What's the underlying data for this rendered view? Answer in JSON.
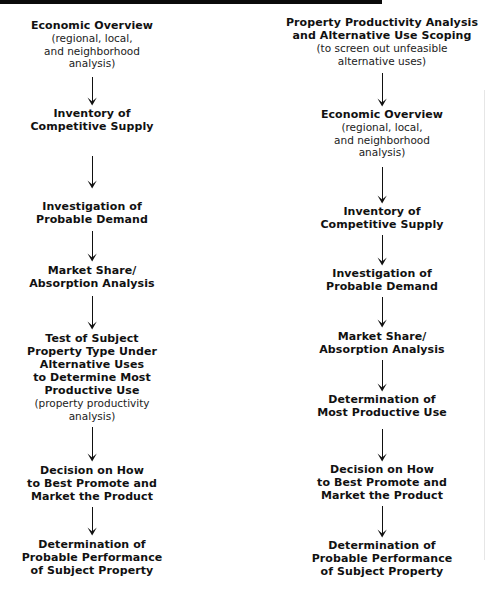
{
  "diagram": {
    "left_column": {
      "center_x": 92,
      "nodes": [
        {
          "top": 19,
          "title": [
            "Economic Overview"
          ],
          "sub": [
            "(regional, local,",
            "and neighborhood",
            "analysis)"
          ]
        },
        {
          "top": 107,
          "title": [
            "Inventory of",
            "Competitive Supply"
          ],
          "sub": []
        },
        {
          "top": 200,
          "title": [
            "Investigation of",
            "Probable Demand"
          ],
          "sub": []
        },
        {
          "top": 264,
          "title": [
            "Market Share/",
            "Absorption Analysis"
          ],
          "sub": []
        },
        {
          "top": 332,
          "title": [
            "Test of Subject",
            "Property Type Under",
            "Alternative Uses",
            "to Determine Most",
            "Productive Use"
          ],
          "sub": [
            "(property productivity",
            "analysis)"
          ]
        },
        {
          "top": 464,
          "title": [
            "Decision on How",
            "to Best Promote and",
            "Market the Product"
          ],
          "sub": []
        },
        {
          "top": 538,
          "title": [
            "Determination of",
            "Probable Performance",
            "of Subject Property"
          ],
          "sub": []
        }
      ],
      "arrows": [
        {
          "top": 77,
          "height": 29
        },
        {
          "top": 156,
          "height": 33
        },
        {
          "top": 231,
          "height": 31
        },
        {
          "top": 296,
          "height": 34
        },
        {
          "top": 427,
          "height": 35
        },
        {
          "top": 507,
          "height": 29
        }
      ]
    },
    "right_column": {
      "center_x": 382,
      "nodes": [
        {
          "top": 16,
          "title": [
            "Property Productivity Analysis",
            "and Alternative Use Scoping"
          ],
          "sub": [
            "(to screen out unfeasible",
            "alternative uses)"
          ]
        },
        {
          "top": 108,
          "title": [
            "Economic Overview"
          ],
          "sub": [
            "(regional, local,",
            "and neighborhood",
            "analysis)"
          ]
        },
        {
          "top": 205,
          "title": [
            "Inventory of",
            "Competitive Supply"
          ],
          "sub": []
        },
        {
          "top": 267,
          "title": [
            "Investigation of",
            "Probable Demand"
          ],
          "sub": []
        },
        {
          "top": 330,
          "title": [
            "Market Share/",
            "Absorption Analysis"
          ],
          "sub": []
        },
        {
          "top": 393,
          "title": [
            "Determination of",
            "Most Productive Use"
          ],
          "sub": []
        },
        {
          "top": 463,
          "title": [
            "Decision on How",
            "to Best Promote and",
            "Market the Product"
          ],
          "sub": []
        },
        {
          "top": 539,
          "title": [
            "Determination of",
            "Probable Performance",
            "of Subject Property"
          ],
          "sub": []
        }
      ],
      "arrows": [
        {
          "top": 73,
          "height": 34
        },
        {
          "top": 167,
          "height": 37
        },
        {
          "top": 235,
          "height": 31
        },
        {
          "top": 297,
          "height": 31
        },
        {
          "top": 360,
          "height": 32
        },
        {
          "top": 429,
          "height": 33
        },
        {
          "top": 506,
          "height": 32
        }
      ]
    },
    "colors": {
      "ink": "#111111",
      "background": "#ffffff",
      "header_bar": "#0a0a0a"
    }
  }
}
